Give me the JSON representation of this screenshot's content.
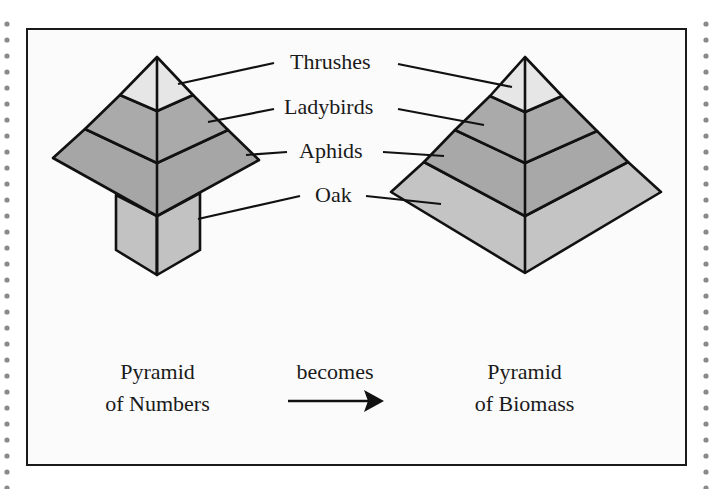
{
  "diagram": {
    "title_labels": {
      "thrushes": "Thrushes",
      "ladybirds": "Ladybirds",
      "aphids": "Aphids",
      "oak": "Oak"
    },
    "left_caption": {
      "line1": "Pyramid",
      "line2": "of Numbers"
    },
    "middle_caption": {
      "label": "becomes"
    },
    "right_caption": {
      "line1": "Pyramid",
      "line2": "of Biomass"
    },
    "colors": {
      "thrushes_fill": "#e6e6e6",
      "ladybirds_fill": "#aaaaaa",
      "aphids_fill": "#a6a6a6",
      "oak_fill": "#c2c2c2",
      "outline": "#111111",
      "frame_bg": "#fbfbfb",
      "dots": "#888888"
    },
    "pyramids": [
      {
        "name": "Pyramid of Numbers",
        "levels": [
          "Thrushes",
          "Ladybirds",
          "Aphids",
          "Oak"
        ],
        "shape": "inverted base: oak narrow box below wide aphid layer"
      },
      {
        "name": "Pyramid of Biomass",
        "levels": [
          "Thrushes",
          "Ladybirds",
          "Aphids",
          "Oak"
        ],
        "shape": "regular pyramid widening to oak base"
      }
    ]
  }
}
